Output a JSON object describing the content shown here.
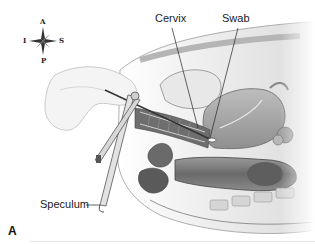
{
  "figure": {
    "panel_letter": "A",
    "labels": {
      "cervix": "Cervix",
      "swab": "Swab",
      "speculum": "Speculum"
    },
    "compass": {
      "top": "A",
      "bottom": "P",
      "left": "I",
      "right": "S"
    },
    "colors": {
      "background": "#ffffff",
      "tissue_light": "#d9d9d9",
      "tissue_mid": "#a8a8a8",
      "tissue_dark": "#5a5a5a",
      "line": "#222222"
    }
  }
}
